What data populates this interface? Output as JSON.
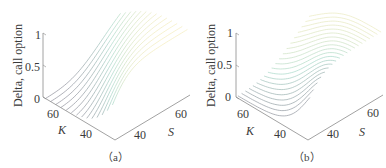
{
  "chart_data": [
    {
      "type": "surface3d",
      "caption": "（a）",
      "title": "",
      "zlabel": "Delta, call option",
      "xlabel": "K",
      "ylabel": "S",
      "z_ticks": [
        "0",
        "0.5",
        "1"
      ],
      "k_ticks": [
        "60",
        "40"
      ],
      "s_ticks": [
        "40",
        "60"
      ],
      "zlim": [
        0,
        1
      ],
      "klim": [
        30,
        70
      ],
      "slim": [
        30,
        70
      ],
      "description": "Call option delta surface over strike K and spot S; curves of delta vs S for several K, rising sigmoid-like from 0 to 1",
      "line_orientation": "constant K slices",
      "num_lines": 14
    },
    {
      "type": "surface3d",
      "caption": "（b）",
      "title": "",
      "zlabel": "Delta, call option",
      "xlabel": "K",
      "ylabel": "S",
      "z_ticks": [
        "0",
        "0.5",
        "1"
      ],
      "k_ticks": [
        "60",
        "40"
      ],
      "s_ticks": [
        "40",
        "60"
      ],
      "zlim": [
        0,
        1
      ],
      "klim": [
        30,
        70
      ],
      "slim": [
        30,
        70
      ],
      "description": "Same call option delta surface, drawn as constant S slices (mesh lines along K)",
      "line_orientation": "constant S slices",
      "num_lines": 20
    }
  ],
  "panels": [
    {
      "zlabel": "Delta, call option",
      "z1": "1",
      "z05": "0.5",
      "z0": "0",
      "k60": "60",
      "k40": "40",
      "kname": "K",
      "s40": "40",
      "s60": "60",
      "sname": "S",
      "caption": "（a）"
    },
    {
      "zlabel": "Delta, call option",
      "z1": "1",
      "z05": "0.5",
      "z0": "0",
      "k60": "60",
      "k40": "40",
      "kname": "K",
      "s40": "40",
      "s60": "60",
      "sname": "S",
      "caption": "（b）"
    }
  ],
  "colors": {
    "axis": "#8a8a8a",
    "low": "#8e8e9a",
    "mid": "#a8d8c8",
    "high": "#f4ecbc"
  }
}
